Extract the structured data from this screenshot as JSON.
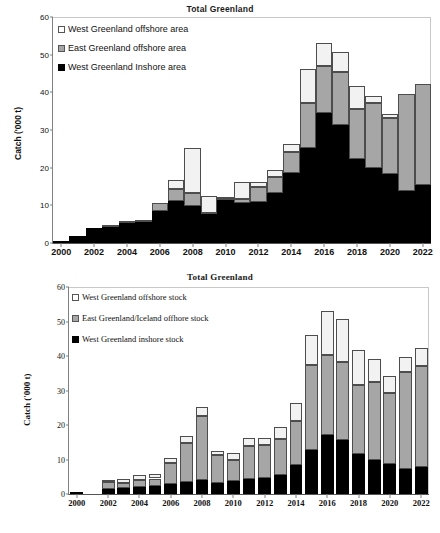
{
  "charts": [
    {
      "title": "Total Greenland",
      "ylabel": "Catch ('000 t)",
      "legend": [
        {
          "label": "West Greenland offshore area",
          "key": "offshore-w"
        },
        {
          "label": "East Greenland offshore area",
          "key": "offshore-e"
        },
        {
          "label": "West Greenland Inshore area",
          "key": "inshore"
        }
      ],
      "yticks": [
        "0",
        "10",
        "20",
        "30",
        "40",
        "50",
        "60"
      ],
      "xticks": [
        "2000",
        "2002",
        "2004",
        "2006",
        "2008",
        "2010",
        "2012",
        "2014",
        "2016",
        "2018",
        "2020",
        "2022"
      ]
    },
    {
      "title": "Total Greenland",
      "ylabel": "Catch ('000 t)",
      "legend": [
        {
          "label": "West Greenland offshore stock",
          "key": "offshore-w"
        },
        {
          "label": "East Greenland/Iceland offhore stock",
          "key": "offshore-e"
        },
        {
          "label": "West Greenland inshore stock",
          "key": "inshore"
        }
      ],
      "yticks": [
        "0",
        "10",
        "20",
        "30",
        "40",
        "50",
        "60"
      ],
      "xticks": [
        "2000",
        "2002",
        "2004",
        "2006",
        "2008",
        "2010",
        "2012",
        "2014",
        "2016",
        "2018",
        "2020",
        "2022"
      ]
    }
  ],
  "chart_data": [
    {
      "type": "bar",
      "stacked": true,
      "title": "Total Greenland",
      "xlabel": "",
      "ylabel": "Catch ('000 t)",
      "ylim": [
        0,
        60
      ],
      "ytick_step": 10,
      "grid": false,
      "legend_position": "upper-left",
      "colors": {
        "West Greenland Inshore area": "#000000",
        "East Greenland offshore area": "#a6a6a6",
        "West Greenland offshore area": "#f2f2f2"
      },
      "categories": [
        2000,
        2001,
        2002,
        2003,
        2004,
        2005,
        2006,
        2007,
        2008,
        2009,
        2010,
        2011,
        2012,
        2013,
        2014,
        2015,
        2016,
        2017,
        2018,
        2019,
        2020,
        2021,
        2022
      ],
      "series": [
        {
          "name": "West Greenland Inshore area",
          "values": [
            0.6,
            1.8,
            4.1,
            4.2,
            5.3,
            5.7,
            8.6,
            11.1,
            9.9,
            7.8,
            11.4,
            10.5,
            11.0,
            13.2,
            18.5,
            25.3,
            34.4,
            31.3,
            22.4,
            19.8,
            18.2,
            13.9,
            15.4
          ]
        },
        {
          "name": "East Greenland offshore area",
          "values": [
            0.0,
            0.0,
            0.0,
            0.2,
            0.3,
            0.2,
            1.9,
            3.2,
            3.5,
            0.3,
            0.4,
            1.2,
            3.8,
            4.3,
            5.7,
            12.0,
            12.7,
            14.0,
            13.3,
            17.3,
            15.1,
            25.7,
            26.8
          ]
        },
        {
          "name": "West Greenland offshore area",
          "values": [
            0.0,
            0.0,
            0.0,
            0.0,
            0.0,
            0.0,
            0.0,
            2.4,
            11.9,
            4.5,
            0.2,
            4.4,
            1.5,
            2.0,
            2.2,
            9.0,
            5.9,
            5.5,
            6.1,
            1.9,
            0.9,
            0.0,
            0.0
          ]
        }
      ],
      "totals": [
        0.6,
        1.8,
        4.1,
        4.4,
        5.6,
        5.9,
        10.5,
        16.7,
        25.3,
        12.6,
        12.0,
        16.1,
        16.3,
        19.5,
        26.4,
        46.3,
        53.0,
        50.8,
        41.8,
        39.0,
        34.2,
        39.6,
        42.2
      ]
    },
    {
      "type": "bar",
      "stacked": true,
      "title": "Total Greenland",
      "xlabel": "",
      "ylabel": "Catch ('000 t)",
      "ylim": [
        0,
        60
      ],
      "ytick_step": 10,
      "grid": false,
      "legend_position": "upper-left",
      "colors": {
        "West Greenland inshore stock": "#000000",
        "East Greenland/Iceland offhore stock": "#a6a6a6",
        "West Greenland offshore stock": "#f2f2f2"
      },
      "categories": [
        2000,
        2001,
        2002,
        2003,
        2004,
        2005,
        2006,
        2007,
        2008,
        2009,
        2010,
        2011,
        2012,
        2013,
        2014,
        2015,
        2016,
        2017,
        2018,
        2019,
        2020,
        2021,
        2022
      ],
      "series": [
        {
          "name": "West Greenland inshore stock",
          "values": [
            0.6,
            0.0,
            1.4,
            1.7,
            2.0,
            2.3,
            2.9,
            3.6,
            4.2,
            3.2,
            3.9,
            4.4,
            4.6,
            5.5,
            8.5,
            12.7,
            17.1,
            15.6,
            11.6,
            9.8,
            8.6,
            7.3,
            7.7
          ]
        },
        {
          "name": "East Greenland/Iceland offhore stock",
          "values": [
            0.0,
            0.0,
            2.0,
            1.4,
            2.0,
            2.2,
            6.0,
            11.1,
            18.3,
            8.1,
            6.0,
            9.5,
            9.7,
            10.4,
            12.6,
            24.6,
            23.3,
            22.7,
            20.1,
            22.6,
            20.7,
            28.2,
            29.4
          ]
        },
        {
          "name": "West Greenland offshore stock",
          "values": [
            0.0,
            0.0,
            0.8,
            1.3,
            1.6,
            1.4,
            1.6,
            2.0,
            2.8,
            1.3,
            2.1,
            2.2,
            2.0,
            3.6,
            5.3,
            8.9,
            12.6,
            12.5,
            10.1,
            6.6,
            4.9,
            4.3,
            5.1
          ]
        }
      ],
      "totals": [
        0.6,
        0.0,
        4.2,
        4.4,
        5.6,
        5.9,
        10.5,
        16.7,
        25.3,
        12.6,
        12.0,
        16.1,
        16.3,
        19.5,
        26.4,
        46.2,
        53.0,
        50.8,
        41.8,
        39.0,
        34.2,
        39.8,
        42.2
      ]
    }
  ]
}
